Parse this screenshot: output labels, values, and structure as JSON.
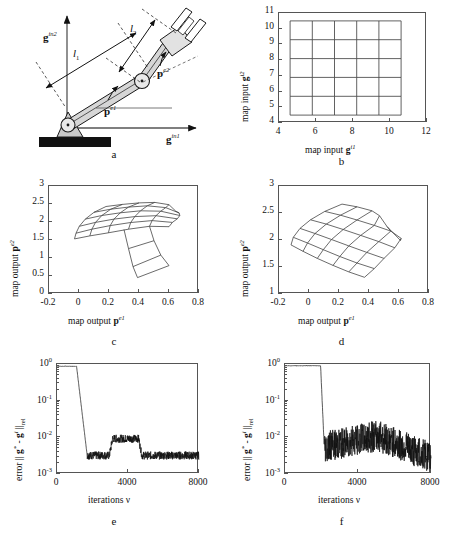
{
  "figure": {
    "panels": [
      {
        "id": "a",
        "letter": "a"
      },
      {
        "id": "b",
        "letter": "b"
      },
      {
        "id": "c",
        "letter": "c"
      },
      {
        "id": "d",
        "letter": "d"
      },
      {
        "id": "e",
        "letter": "e"
      },
      {
        "id": "f",
        "letter": "f"
      }
    ]
  },
  "panel_a": {
    "letter": "a",
    "labels": {
      "axis_y": "g",
      "axis_y_sup": "in2",
      "axis_x": "g",
      "axis_x_sup": "in1",
      "link1": "l",
      "link1_sub": "1",
      "link2": "l",
      "link2_sub": "2",
      "angle1": "p",
      "angle1_sup": "e1",
      "angle2": "p",
      "angle2_sup": "e2"
    },
    "description": "Two-link planar robot arm with base pedestal, shoulder joint, elbow joint and two-prong gripper end effector.",
    "colors": {
      "base_fill": "#111111",
      "mount_fill": "#c9c9c9",
      "link_fill": "#d6d6d6",
      "stroke": "#1a1a1a"
    }
  },
  "chart_data": [
    {
      "panel": "b",
      "type": "line",
      "title": "",
      "xlabel": "map input g^i1",
      "ylabel": "map input g^i2",
      "xlim": [
        4,
        12
      ],
      "ylim": [
        4,
        11
      ],
      "xticks": [
        4,
        6,
        8,
        10,
        12
      ],
      "yticks": [
        4,
        5,
        6,
        7,
        8,
        9,
        10,
        11
      ],
      "grid": false,
      "annotation": "Regular undistorted 5x5 quadrilateral mesh of map input nodes",
      "mesh": {
        "rows": 6,
        "cols": 6,
        "x_nodes": [
          4.6,
          5.8,
          7.0,
          8.2,
          9.4,
          10.6
        ],
        "y_nodes": [
          4.5,
          5.7,
          6.9,
          8.1,
          9.3,
          10.5
        ]
      }
    },
    {
      "panel": "c",
      "type": "line",
      "title": "",
      "xlabel": "map output p^e1",
      "ylabel": "map output p^e2",
      "xlim": [
        -0.2,
        0.8
      ],
      "ylim": [
        0,
        3
      ],
      "xticks": [
        -0.2,
        0,
        0.2,
        0.4,
        0.6,
        0.8
      ],
      "yticks": [
        0,
        0.5,
        1,
        1.5,
        2,
        2.5,
        3
      ],
      "grid": false,
      "annotation": "Distorted output mesh with a fold/overlap at the lower right corner",
      "mesh_points": [
        [
          [
            -0.03,
            1.53
          ],
          [
            0.072,
            1.615
          ],
          [
            0.196,
            1.7
          ],
          [
            0.33,
            1.8
          ],
          [
            0.47,
            1.88
          ],
          [
            0.6,
            1.87
          ]
        ],
        [
          [
            -0.02,
            1.69
          ],
          [
            0.086,
            1.8
          ],
          [
            0.208,
            1.9
          ],
          [
            0.345,
            1.985
          ],
          [
            0.487,
            2.04
          ],
          [
            0.623,
            1.99
          ]
        ],
        [
          [
            0.002,
            1.88
          ],
          [
            0.11,
            1.99
          ],
          [
            0.233,
            2.08
          ],
          [
            0.372,
            2.15
          ],
          [
            0.513,
            2.175
          ],
          [
            0.655,
            2.09
          ]
        ],
        [
          [
            0.042,
            2.08
          ],
          [
            0.152,
            2.18
          ],
          [
            0.275,
            2.255
          ],
          [
            0.41,
            2.31
          ],
          [
            0.545,
            2.3
          ],
          [
            0.672,
            2.18
          ]
        ],
        [
          [
            0.1,
            2.27
          ],
          [
            0.212,
            2.355
          ],
          [
            0.33,
            2.415
          ],
          [
            0.455,
            2.45
          ],
          [
            0.578,
            2.4
          ],
          [
            0.668,
            2.25
          ]
        ],
        [
          [
            0.18,
            2.43
          ],
          [
            0.29,
            2.49
          ],
          [
            0.4,
            2.53
          ],
          [
            0.505,
            2.545
          ],
          [
            0.6,
            2.48
          ],
          [
            0.645,
            2.3
          ]
        ]
      ],
      "fold_points": [
        [
          [
            0.3,
            1.79
          ],
          [
            0.33,
            1.26
          ],
          [
            0.36,
            0.76
          ],
          [
            0.39,
            0.455
          ]
        ],
        [
          [
            0.47,
            1.88
          ],
          [
            0.5,
            1.48
          ],
          [
            0.545,
            1.08
          ],
          [
            0.6,
            0.79
          ]
        ]
      ]
    },
    {
      "panel": "d",
      "type": "line",
      "title": "",
      "xlabel": "map output p^e1",
      "ylabel": "map output p^e2",
      "xlim": [
        -0.2,
        0.8
      ],
      "ylim": [
        1,
        3
      ],
      "xticks": [
        -0.2,
        0,
        0.2,
        0.4,
        0.6,
        0.8
      ],
      "yticks": [
        1,
        1.5,
        2,
        2.5,
        3
      ],
      "grid": false,
      "annotation": "Smooth fan-shaped warped output mesh, no folding",
      "mesh_points": [
        [
          [
            -0.12,
            1.91
          ],
          [
            -0.04,
            1.79
          ],
          [
            0.055,
            1.66
          ],
          [
            0.16,
            1.53
          ],
          [
            0.265,
            1.41
          ],
          [
            0.37,
            1.31
          ]
        ],
        [
          [
            -0.105,
            2.05
          ],
          [
            -0.01,
            1.945
          ],
          [
            0.095,
            1.82
          ],
          [
            0.205,
            1.695
          ],
          [
            0.32,
            1.575
          ],
          [
            0.435,
            1.47
          ]
        ],
        [
          [
            -0.06,
            2.215
          ],
          [
            0.04,
            2.12
          ],
          [
            0.15,
            2.01
          ],
          [
            0.265,
            1.89
          ],
          [
            0.385,
            1.77
          ],
          [
            0.5,
            1.66
          ]
        ],
        [
          [
            0.01,
            2.375
          ],
          [
            0.115,
            2.295
          ],
          [
            0.228,
            2.195
          ],
          [
            0.345,
            2.085
          ],
          [
            0.465,
            1.97
          ],
          [
            0.572,
            1.855
          ]
        ],
        [
          [
            0.105,
            2.53
          ],
          [
            0.21,
            2.46
          ],
          [
            0.32,
            2.37
          ],
          [
            0.435,
            2.27
          ],
          [
            0.545,
            2.165
          ],
          [
            0.615,
            2.03
          ]
        ],
        [
          [
            0.22,
            2.665
          ],
          [
            0.32,
            2.615
          ],
          [
            0.42,
            2.54
          ],
          [
            0.47,
            2.45
          ],
          [
            0.52,
            2.25
          ],
          [
            0.61,
            1.99
          ]
        ]
      ]
    },
    {
      "panel": "e",
      "type": "line",
      "title": "",
      "xlabel": "iterations ν",
      "ylabel": "error || g* - g^i ||rel",
      "xlim": [
        0,
        8000
      ],
      "ylim": [
        0.001,
        1
      ],
      "yscale": "log",
      "xticks": [
        0,
        4000,
        8000
      ],
      "yticks": [
        "10^0",
        "10^-1",
        "10^-2",
        "10^-3"
      ],
      "grid": false,
      "annotation": "Error plateaus near 1 until ~1100 iterations, drops to ~3e-3, rises to ~9e-3 between 3000-4600, then returns to ~3e-3",
      "series_description": {
        "plateau_level": 0.88,
        "plateau_end": 1100,
        "drop_end": 1700,
        "low_level_1": 0.0032,
        "bump_start": 2950,
        "bump_end": 4600,
        "bump_level": 0.0092,
        "low_level_2": 0.0032,
        "noise_amplitude": 0.22
      }
    },
    {
      "panel": "f",
      "type": "line",
      "title": "",
      "xlabel": "iterations ν",
      "ylabel": "error || g* - g^i ||rel",
      "xlim": [
        0,
        8000
      ],
      "ylim": [
        0.001,
        1
      ],
      "yscale": "log",
      "xticks": [
        0,
        4000,
        8000
      ],
      "yticks": [
        "10^0",
        "10^-1",
        "10^-2",
        "10^-3"
      ],
      "grid": false,
      "annotation": "Error plateaus near 1 until ~1950 iterations, then drops sharply and fluctuates strongly between 2e-3 and 3e-2 with a slow downward trend",
      "series_description": {
        "plateau_level": 0.9,
        "plateau_end": 1950,
        "drop_end": 2150,
        "mean_level_start": 0.0055,
        "mean_level_mid": 0.011,
        "mean_level_end": 0.0028,
        "noise_amplitude": 0.85
      }
    }
  ]
}
